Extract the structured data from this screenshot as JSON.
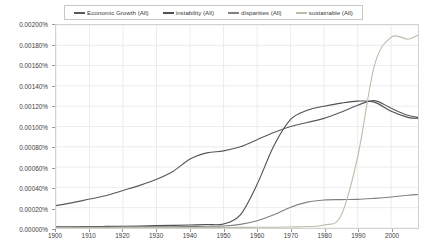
{
  "chart_data": {
    "type": "line",
    "title": "",
    "xlabel": "",
    "ylabel": "",
    "xlim": [
      1900,
      2008
    ],
    "ylim": [
      0.0,
      0.002
    ],
    "grid": true,
    "legend_position": "top-center",
    "y_tick_labels": [
      "0.00200%",
      "0.00180%",
      "0.00160%",
      "0.00140%",
      "0.00120%",
      "0.00100%",
      "0.00080%",
      "0.00060%",
      "0.00040%",
      "0.00020%",
      "0.00000%"
    ],
    "y_tick_values": [
      0.002,
      0.0018,
      0.0016,
      0.0014,
      0.0012,
      0.001,
      0.0008,
      0.0006,
      0.0004,
      0.0002,
      0.0
    ],
    "x_tick_labels": [
      "1900",
      "1910",
      "1920",
      "1930",
      "1940",
      "1950",
      "1960",
      "1970",
      "1980",
      "1990",
      "2000"
    ],
    "x_tick_values": [
      1900,
      1910,
      1920,
      1930,
      1940,
      1950,
      1960,
      1970,
      1980,
      1990,
      2000
    ],
    "x": [
      1900,
      1905,
      1910,
      1915,
      1920,
      1925,
      1930,
      1935,
      1940,
      1945,
      1950,
      1955,
      1960,
      1965,
      1970,
      1975,
      1980,
      1985,
      1990,
      1995,
      2000,
      2005,
      2008
    ],
    "series": [
      {
        "name": "Economic Growth (All)",
        "color": "#595959",
        "values": [
          0.00022,
          0.00025,
          0.000285,
          0.00032,
          0.00037,
          0.00042,
          0.00048,
          0.00056,
          0.00068,
          0.00074,
          0.00076,
          0.0008,
          0.00087,
          0.00094,
          0.001,
          0.00104,
          0.00108,
          0.00114,
          0.00121,
          0.001255,
          0.00118,
          0.00111,
          0.00109
        ]
      },
      {
        "name": "instability (All)",
        "color": "#4f4f4f",
        "values": [
          1.2e-05,
          1.3e-05,
          1.4e-05,
          1.6e-05,
          1.8e-05,
          2e-05,
          2.3e-05,
          2.6e-05,
          3e-05,
          3.4e-05,
          4e-05,
          0.00013,
          0.00043,
          0.00081,
          0.00107,
          0.00116,
          0.0012,
          0.00123,
          0.00125,
          0.00124,
          0.00115,
          0.00109,
          0.00108
        ]
      },
      {
        "name": "disparities (All)",
        "color": "#808080",
        "values": [
          8e-06,
          8e-06,
          9e-06,
          9e-06,
          1e-05,
          1.1e-05,
          1.2e-05,
          1.3e-05,
          1.5e-05,
          1.7e-05,
          2e-05,
          3.6e-05,
          7.2e-05,
          0.00013,
          0.000205,
          0.000255,
          0.000276,
          0.00028,
          0.000282,
          0.000292,
          0.000305,
          0.000322,
          0.00033
        ]
      },
      {
        "name": "sustainable (All)",
        "color": "#b9bfa8",
        "values": [
          3e-06,
          3e-06,
          3e-06,
          3e-06,
          4e-06,
          4e-06,
          4e-06,
          4e-06,
          5e-06,
          5e-06,
          5e-06,
          6e-06,
          7e-06,
          8e-06,
          1e-05,
          1.4e-05,
          3e-05,
          0.00012,
          0.0007,
          0.0016,
          0.00188,
          0.00186,
          0.0019
        ]
      }
    ]
  },
  "legend": {
    "items": [
      {
        "label": "Economic Growth (All)",
        "color": "#595959"
      },
      {
        "label": "instability (All)",
        "color": "#4f4f4f"
      },
      {
        "label": "disparities (All)",
        "color": "#808080"
      },
      {
        "label": "sustainable (All)",
        "color": "#b9bfa8"
      }
    ]
  },
  "style": {
    "grid_color": "#ececec",
    "frame_color": "#d2d2d2",
    "tick_color": "#9a9a9a",
    "background": "#ffffff"
  }
}
